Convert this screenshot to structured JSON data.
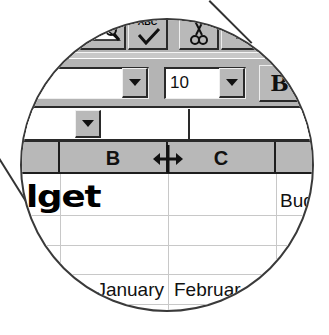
{
  "toolbar_standard": {
    "buttons": [
      {
        "icon": "print-preview-icon"
      },
      {
        "icon": "spelling-icon",
        "glyph_text": "ABC"
      },
      {
        "icon": "cut-icon"
      },
      {
        "icon": "copy-icon"
      }
    ]
  },
  "toolbar_formatting": {
    "font_name_value": "",
    "font_size_value": "10",
    "bold_label": "B"
  },
  "formula_bar": {
    "name_box_value": "",
    "formula_value": ""
  },
  "column_headers": [
    "B",
    "C"
  ],
  "cursor": {
    "icon": "column-resize-cursor",
    "glyph": "↔"
  },
  "cells": {
    "title_fragment": "lget",
    "d1_fragment": "Bud",
    "b4": "January",
    "c4": "Februar",
    "b5_fragment": "900",
    "c5_fragment": "1"
  },
  "colors": {
    "toolbar_gray": "#b4b4b4",
    "header_gray": "#b8b8b8",
    "gridline": "#c8c8c8",
    "lens_border": "#3a3a3a"
  }
}
